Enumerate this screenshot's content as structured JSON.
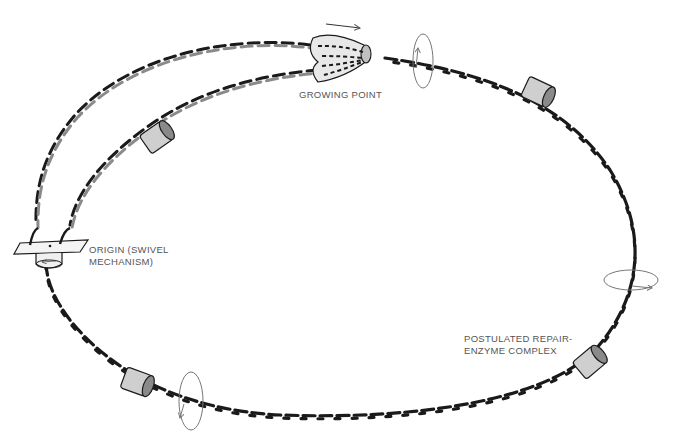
{
  "diagram": {
    "labels": {
      "growing_point": "GROWING POINT",
      "origin_line1": "ORIGIN (SWIVEL",
      "origin_line2": "MECHANISM)",
      "repair_line1": "POSTULATED REPAIR-",
      "repair_line2": "ENZYME COMPLEX"
    },
    "components": [
      {
        "name": "origin-swivel",
        "kind": "swivel mechanism"
      },
      {
        "name": "growing-point",
        "kind": "replication fork"
      },
      {
        "name": "repair-enzyme-complex",
        "kind": "cylinder",
        "count": 4
      },
      {
        "name": "rotation-indicator",
        "kind": "ellipse arrow",
        "count": 3
      }
    ],
    "colors": {
      "parent_strand": "#1a1a1a",
      "new_strand": "#8a8a8a",
      "enzyme_fill": "#c8c8c8",
      "enzyme_inner": "#7a7a7a",
      "label_text": "#555555",
      "rotation_arrow": "#777777"
    }
  }
}
